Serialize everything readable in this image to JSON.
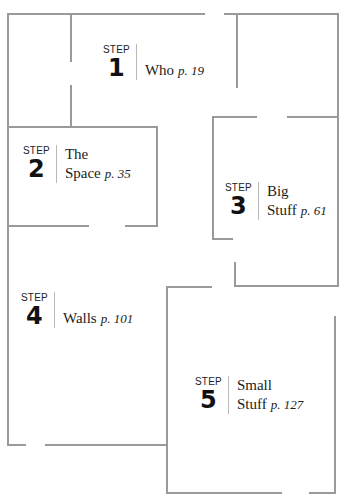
{
  "steps": [
    {
      "label": "STEP",
      "number": "1",
      "title_lines": [
        "Who"
      ],
      "page": "p. 19"
    },
    {
      "label": "STEP",
      "number": "2",
      "title_lines": [
        "The",
        "Space"
      ],
      "page": "p. 35"
    },
    {
      "label": "STEP",
      "number": "3",
      "title_lines": [
        "Big",
        "Stuff"
      ],
      "page": "p. 61"
    },
    {
      "label": "STEP",
      "number": "4",
      "title_lines": [
        "Walls"
      ],
      "page": "p. 101"
    },
    {
      "label": "STEP",
      "number": "5",
      "title_lines": [
        "Small",
        "Stuff"
      ],
      "page": "p. 127"
    }
  ],
  "colors": {
    "wall": "#9a9a9a",
    "text": "#222222"
  }
}
